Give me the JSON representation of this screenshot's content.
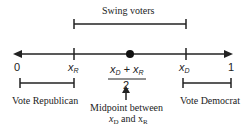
{
  "axis": {
    "left_label": "0",
    "right_label": "1",
    "xr_label": "x",
    "xr_sub": "R",
    "xd_label": "x",
    "xd_sub": "D"
  },
  "midpoint": {
    "numerator": "x",
    "num_sub1": "D",
    "plus": " + x",
    "num_sub2": "R",
    "denominator": "2",
    "caption_line1": "Midpoint between",
    "caption_line2_a": "x",
    "caption_line2_a_sub": "D",
    "caption_line2_b": " and x",
    "caption_line2_b_sub": "R"
  },
  "brackets": {
    "swing": "Swing voters",
    "republican": "Vote Republican",
    "democrat": "Vote Democrat"
  },
  "colors": {
    "line": "#222222",
    "text": "#222222"
  }
}
